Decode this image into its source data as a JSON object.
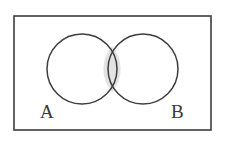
{
  "figure": {
    "kind": "venn-diagram",
    "title": "",
    "background_color": "#ffffff"
  },
  "universe": {
    "shape": "rectangle",
    "label": "",
    "stroke_color": "#3d3d3d",
    "fill_color": "#ffffff",
    "x": 14,
    "y": 16,
    "width": 197,
    "height": 114,
    "stroke_width": 1.6
  },
  "sets": [
    {
      "name": "A",
      "label": "A",
      "label_x": 40,
      "label_y": 118,
      "cx": 82,
      "cy": 69,
      "r": 35,
      "stroke_color": "#3d3d3d",
      "fill_color": "none",
      "stroke_width": 1.5
    },
    {
      "name": "B",
      "label": "B",
      "label_x": 171,
      "label_y": 118,
      "cx": 143,
      "cy": 69,
      "r": 35,
      "stroke_color": "#3d3d3d",
      "fill_color": "none",
      "stroke_width": 1.5
    }
  ],
  "intersection": {
    "name": "A-intersect-B",
    "label": "",
    "shaded": true,
    "fill_color": "#e3e3e3",
    "top_point_x": 112,
    "top_point_y": 46,
    "bottom_point_x": 112,
    "bottom_point_y": 92
  },
  "colors": {
    "stroke": "#3d3d3d",
    "shade": "#e3e3e3",
    "label_text": "#3a3a3a",
    "page_background": "#ffffff"
  }
}
